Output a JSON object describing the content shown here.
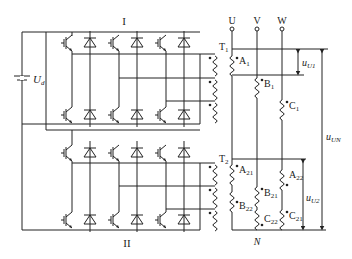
{
  "diagram": {
    "type": "circuit-schematic",
    "labels": {
      "bridge_top": "I",
      "bridge_bottom": "II",
      "dc_source": "U",
      "dc_source_sub": "d",
      "transformer1": "T",
      "transformer1_sub": "1",
      "transformer2": "T",
      "transformer2_sub": "2",
      "terminal_u": "U",
      "terminal_v": "V",
      "terminal_w": "W",
      "neutral": "N",
      "winding_a1": "A",
      "winding_a1_sub": "1",
      "winding_b1": "B",
      "winding_b1_sub": "1",
      "winding_c1": "C",
      "winding_c1_sub": "1",
      "winding_a21": "A",
      "winding_a21_sub": "21",
      "winding_b22": "B",
      "winding_b22_sub": "22",
      "winding_b21": "B",
      "winding_b21_sub": "21",
      "winding_c22": "C",
      "winding_c22_sub": "22",
      "winding_a22": "A",
      "winding_a22_sub": "22",
      "winding_c21": "C",
      "winding_c21_sub": "21",
      "voltage_u1": "u",
      "voltage_u1_sub": "U1",
      "voltage_u2": "u",
      "voltage_u2_sub": "U2",
      "voltage_un": "u",
      "voltage_un_sub": "UN"
    }
  }
}
